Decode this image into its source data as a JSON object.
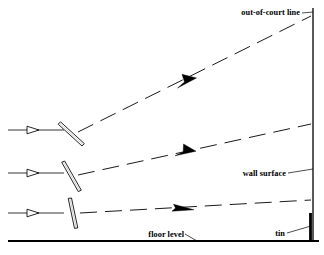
{
  "figure": {
    "type": "technical-diagram",
    "background_color": "#ffffff",
    "stroke_color": "#000000",
    "width": 324,
    "height": 255
  },
  "labels": {
    "out_of_court_line": "out-of-court line",
    "wall_surface": "wall surface",
    "floor_level": "floor level",
    "tin": "tin"
  },
  "court": {
    "front_wall": {
      "name": "front-wall",
      "x": 313,
      "y_top": 8,
      "y_bottom": 241,
      "stroke_width": 1.3
    },
    "tin": {
      "name": "tin-band",
      "x": 310,
      "y_top": 213,
      "y_bottom": 240,
      "stroke_width": 2.6
    },
    "floor": {
      "name": "floor-line",
      "x_start": 8,
      "x_end": 318,
      "y": 241,
      "stroke_width": 2.2
    }
  },
  "shots": [
    {
      "id": "high-lob",
      "racket_angle_label": "open face",
      "incoming": {
        "x1": 8,
        "y1": 130,
        "x2": 62,
        "y2": 130
      },
      "incoming_arrow_x": 33,
      "racket": {
        "cx": 70,
        "cy": 133,
        "angle_deg": 36,
        "length": 29,
        "width": 3.6
      },
      "trajectory": {
        "x1": 78,
        "y1": 132,
        "x2": 311,
        "y2": 16
      },
      "arrow_t": 0.42,
      "wall_contact_y": 16
    },
    {
      "id": "mid-drive",
      "racket_angle_label": "slightly open face",
      "incoming": {
        "x1": 8,
        "y1": 173,
        "x2": 62,
        "y2": 173
      },
      "incoming_arrow_x": 33,
      "racket": {
        "cx": 71,
        "cy": 176,
        "angle_deg": 60,
        "length": 29,
        "width": 3.6
      },
      "trajectory": {
        "x1": 78,
        "y1": 175,
        "x2": 311,
        "y2": 124
      },
      "arrow_t": 0.42,
      "wall_contact_y": 124
    },
    {
      "id": "low-kill",
      "racket_angle_label": "vertical face",
      "incoming": {
        "x1": 8,
        "y1": 213,
        "x2": 62,
        "y2": 213
      },
      "incoming_arrow_x": 33,
      "racket": {
        "cx": 73,
        "cy": 213,
        "angle_deg": 80,
        "length": 30,
        "width": 3.6
      },
      "trajectory": {
        "x1": 80,
        "y1": 213,
        "x2": 311,
        "y2": 200
      },
      "arrow_t": 0.42,
      "wall_contact_y": 200
    }
  ],
  "leaders": {
    "out_of_court_line": {
      "x1": 302,
      "y1": 13,
      "x2": 312,
      "y2": 12
    },
    "wall_surface": {
      "x1": 288,
      "y1": 173,
      "x2": 312,
      "y2": 169
    },
    "tin": {
      "x1": 287,
      "y1": 233,
      "x2": 311,
      "y2": 226
    },
    "floor_level": {
      "x1": 185,
      "y1": 234,
      "x2": 196,
      "y2": 241
    }
  },
  "label_positions": {
    "out_of_court_line": {
      "x": 300,
      "y": 15
    },
    "wall_surface": {
      "x": 286,
      "y": 176
    },
    "tin": {
      "x": 285,
      "y": 236
    },
    "floor_level": {
      "x": 184,
      "y": 237
    }
  }
}
